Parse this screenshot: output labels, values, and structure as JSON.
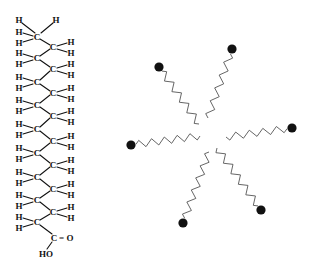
{
  "figure": {
    "left_panel": {
      "name": "fatty-acid-structure",
      "atom_labels": {
        "carbon": "C",
        "hydrogen": "H",
        "carbonyl": "C",
        "double_bond_oxygen": "= O",
        "hydroxyl": "HO"
      },
      "top_carbon": {
        "x": 38,
        "y": 37
      },
      "left_carbons_y": [
        37,
        58,
        82,
        105,
        129,
        153,
        177,
        200,
        222
      ],
      "right_carbons_y": [
        47,
        69,
        93,
        116,
        141,
        165,
        189,
        212
      ],
      "left_x": 37,
      "right_x": 53,
      "carboxyl": {
        "x": 54,
        "y": 238
      }
    },
    "right_panel": {
      "name": "micelle-schematic",
      "tail_count": 6,
      "tails": [
        {
          "id": "tail-upper-left",
          "head": [
            159,
            67
          ],
          "inner": [
            199,
            124
          ]
        },
        {
          "id": "tail-upper-right",
          "head": [
            232,
            49
          ],
          "inner": [
            208,
            118
          ]
        },
        {
          "id": "tail-left",
          "head": [
            131,
            145
          ],
          "inner": [
            200,
            136
          ]
        },
        {
          "id": "tail-right",
          "head": [
            292,
            128
          ],
          "inner": [
            226,
            137
          ]
        },
        {
          "id": "tail-lower-left",
          "head": [
            183,
            223
          ],
          "inner": [
            209,
            152
          ]
        },
        {
          "id": "tail-lower-right",
          "head": [
            261,
            210
          ],
          "inner": [
            217,
            148
          ]
        }
      ],
      "colors": {
        "head": "#111111",
        "tail": "#555555"
      }
    }
  }
}
